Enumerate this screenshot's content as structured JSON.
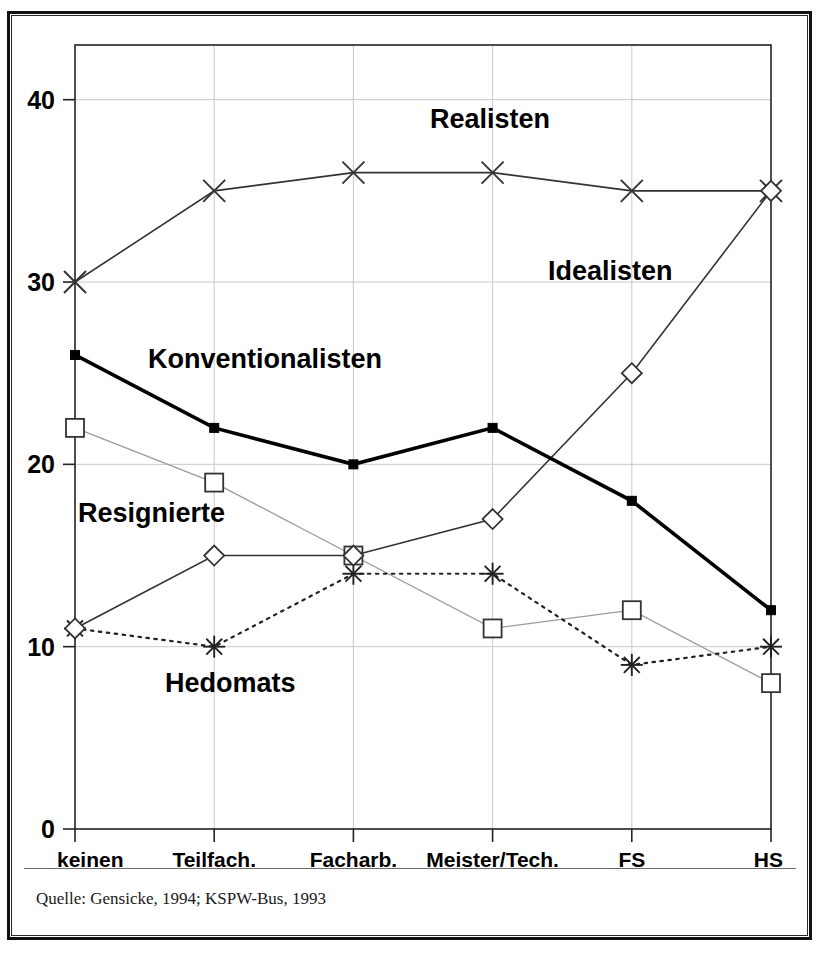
{
  "figure": {
    "source_note": "Quelle: Gensicke, 1994; KSPW-Bus, 1993"
  },
  "chart_data": {
    "type": "line",
    "title": "",
    "xlabel": "",
    "ylabel": "",
    "categories": [
      "keinen",
      "Teilfach.",
      "Facharb.",
      "Meister/Tech.",
      "FS",
      "HS"
    ],
    "ylim": [
      0,
      43
    ],
    "yticks": [
      0,
      10,
      20,
      30,
      40
    ],
    "ytick_labels": [
      "0",
      "10",
      "20",
      "30",
      "40"
    ],
    "grid": true,
    "legend_position": "inline-annotations",
    "series": [
      {
        "name": "Realisten",
        "marker": "x-cross",
        "line_style": "solid-thin",
        "color": "#333333",
        "values": [
          30,
          35,
          36,
          36,
          35,
          35
        ],
        "label_x": 430,
        "label_y": 128
      },
      {
        "name": "Idealisten",
        "marker": "open-diamond",
        "line_style": "solid-thin",
        "color": "#333333",
        "values": [
          11,
          15,
          15,
          17,
          25,
          35
        ],
        "label_x": 548,
        "label_y": 280
      },
      {
        "name": "Konventionalisten",
        "marker": "filled-square",
        "line_style": "solid-thick",
        "color": "#000000",
        "values": [
          26,
          22,
          20,
          22,
          18,
          12
        ],
        "label_x": 148,
        "label_y": 368
      },
      {
        "name": "Resignierte",
        "marker": "open-square",
        "line_style": "solid-faint",
        "color": "#9a9a9a",
        "values": [
          22,
          19,
          15,
          11,
          12,
          8
        ],
        "label_x": 78,
        "label_y": 522
      },
      {
        "name": "Hedomats",
        "marker": "asterisk",
        "line_style": "dotted",
        "color": "#222222",
        "values": [
          11,
          10,
          14,
          14,
          9,
          10
        ],
        "label_x": 165,
        "label_y": 692
      }
    ]
  }
}
